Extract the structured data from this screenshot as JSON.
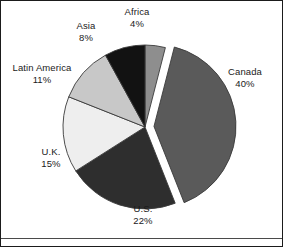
{
  "figure": {
    "background_color": "#ffffff",
    "border_color": "#1b1b1b",
    "rule_color": "#4a4a4a",
    "label_color": "#1a1a1a"
  },
  "chart_data": {
    "type": "pie",
    "title": "",
    "subtitle": "",
    "xlabel": "",
    "ylabel": "",
    "legend_position": "none",
    "grid": false,
    "labels_outside": true,
    "start_angle_deg": 0,
    "direction": "clockwise",
    "units": "percent",
    "total": 100,
    "categories": [
      "Africa",
      "Canada",
      "U.S.",
      "U.K.",
      "Latin America",
      "Asia"
    ],
    "values": [
      4,
      40,
      22,
      15,
      11,
      8
    ],
    "colors": [
      "#8e8e8e",
      "#5a5a5a",
      "#2e2e2e",
      "#eeeeee",
      "#c8c8c8",
      "#121212"
    ],
    "exploded": [
      "Canada"
    ],
    "slices": [
      {
        "name": "Africa",
        "label": "Africa",
        "value": 4,
        "value_label": "4%",
        "color": "#8e8e8e",
        "exploded": false,
        "start_angle_deg": 0,
        "end_angle_deg": 14.4
      },
      {
        "name": "Canada",
        "label": "Canada",
        "value": 40,
        "value_label": "40%",
        "color": "#5a5a5a",
        "exploded": true,
        "start_angle_deg": 14.4,
        "end_angle_deg": 158.4
      },
      {
        "name": "U.S.",
        "label": "U.S.",
        "value": 22,
        "value_label": "22%",
        "color": "#2e2e2e",
        "exploded": false,
        "start_angle_deg": 158.4,
        "end_angle_deg": 237.6
      },
      {
        "name": "U.K.",
        "label": "U.K.",
        "value": 15,
        "value_label": "15%",
        "color": "#eeeeee",
        "exploded": false,
        "start_angle_deg": 237.6,
        "end_angle_deg": 291.6
      },
      {
        "name": "Latin America",
        "label": "Latin America",
        "value": 11,
        "value_label": "11%",
        "color": "#c8c8c8",
        "exploded": false,
        "start_angle_deg": 291.6,
        "end_angle_deg": 331.2
      },
      {
        "name": "Asia",
        "label": "Asia",
        "value": 8,
        "value_label": "8%",
        "color": "#121212",
        "exploded": false,
        "start_angle_deg": 331.2,
        "end_angle_deg": 360
      }
    ]
  }
}
